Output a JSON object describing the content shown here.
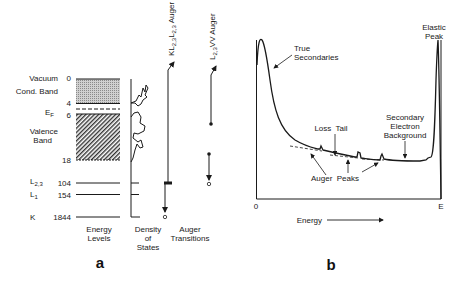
{
  "panel_a": {
    "letter": "a",
    "energy_levels": {
      "title_line1": "Energy",
      "title_line2": "Levels",
      "levels": [
        {
          "name": "Vacuum",
          "value": "0"
        },
        {
          "name": "Cond. Band",
          "value": "4"
        },
        {
          "name": "E",
          "sub": "F",
          "value": "6"
        },
        {
          "name": "Valence",
          "name2": "Band",
          "value": "18"
        },
        {
          "name": "L",
          "sub": "2,3",
          "value": "104"
        },
        {
          "name": "L",
          "sub": "1",
          "value": "154"
        },
        {
          "name": "K",
          "value": "1844"
        }
      ]
    },
    "density_of_states": {
      "title_line1": "Density",
      "title_line2": "of",
      "title_line3": "States"
    },
    "auger_transitions": {
      "title_line1": "Auger",
      "title_line2": "Transitions",
      "transition_1": {
        "prefix": "KL",
        "sub1": "2,3",
        "mid": "L",
        "sub2": "2,3",
        "suffix": " Auger"
      },
      "transition_2": {
        "prefix": "L",
        "sub1": "2,3",
        "suffix": "VV Auger"
      }
    }
  },
  "panel_b": {
    "letter": "b",
    "annotations": {
      "elastic_peak_1": "Elastic",
      "elastic_peak_2": "Peak",
      "true_secondaries_1": "True",
      "true_secondaries_2": "Secondaries",
      "loss_tail": "Loss  Tail",
      "secondary_bg_1": "Secondary",
      "secondary_bg_2": "Electron",
      "secondary_bg_3": "Background",
      "auger_peaks": "Auger  Peaks"
    },
    "x_axis": {
      "start": "0",
      "end": "E",
      "label": "Energy"
    }
  },
  "colors": {
    "ink": "#1a1a1a",
    "background": "#ffffff",
    "hatch": "#555555"
  }
}
